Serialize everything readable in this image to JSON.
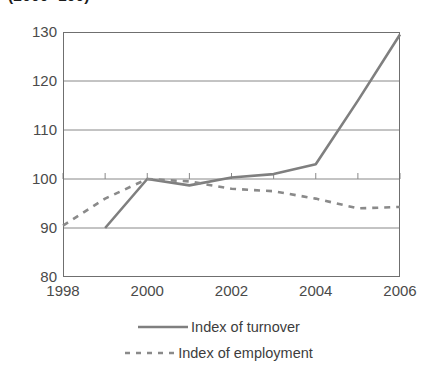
{
  "chart_data": {
    "type": "line",
    "title": "(2000=100)",
    "xlabel": "",
    "ylabel": "",
    "x": [
      1998,
      1999,
      2000,
      2001,
      2002,
      2003,
      2004,
      2005,
      2006
    ],
    "xlim": [
      1998,
      2006
    ],
    "ylim": [
      80,
      130
    ],
    "y_ticks": [
      80,
      90,
      100,
      110,
      120,
      130
    ],
    "x_ticks": [
      1998,
      2000,
      2002,
      2004,
      2006
    ],
    "x_tick_labels": [
      "1998",
      "2000",
      "2002",
      "2004",
      "2006"
    ],
    "y_tick_labels": [
      "80",
      "90",
      "100",
      "110",
      "120",
      "130"
    ],
    "x_minor_ticks": [
      1999,
      2001,
      2003,
      2005
    ],
    "grid": "horizontal",
    "legend_position": "bottom",
    "series": [
      {
        "name": "Index of turnover",
        "style": "solid",
        "color": "#7f7f7f",
        "x": [
          1999,
          2000,
          2001,
          2002,
          2003,
          2004,
          2005,
          2006
        ],
        "values": [
          90.0,
          100.0,
          98.7,
          100.3,
          101.0,
          103.0,
          116.0,
          129.5
        ]
      },
      {
        "name": "Index of employment",
        "style": "dashed",
        "color": "#8a8a8a",
        "x": [
          1998,
          1999,
          2000,
          2001,
          2002,
          2003,
          2004,
          2005,
          2006
        ],
        "values": [
          90.5,
          96.0,
          100.0,
          99.5,
          98.0,
          97.5,
          96.0,
          94.0,
          94.3
        ]
      }
    ]
  },
  "legend": {
    "items": [
      {
        "label": "Index of turnover",
        "style": "solid"
      },
      {
        "label": "Index of employment",
        "style": "dashed"
      }
    ]
  },
  "colors": {
    "series_turnover": "#7f7f7f",
    "series_employment": "#8a8a8a",
    "axis": "#6f6f6f",
    "gridline": "#888888",
    "text": "#4a4a4a"
  }
}
